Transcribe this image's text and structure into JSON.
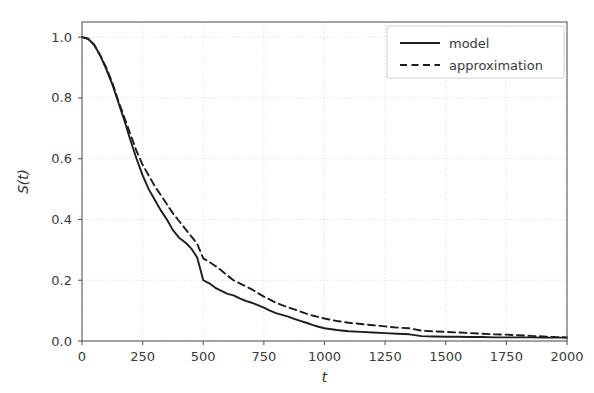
{
  "chart_data": {
    "type": "line",
    "title": "",
    "xlabel": "t",
    "ylabel": "S(t)",
    "xlim": [
      0,
      2000
    ],
    "ylim": [
      0.0,
      1.05
    ],
    "grid": true,
    "legend_position": "upper right",
    "x_ticks": [
      0,
      250,
      500,
      750,
      1000,
      1250,
      1500,
      1750,
      2000
    ],
    "x_tick_labels": [
      "0",
      "250",
      "500",
      "750",
      "1000",
      "1250",
      "1500",
      "1750",
      "2000"
    ],
    "y_ticks": [
      0.0,
      0.2,
      0.4,
      0.6,
      0.8,
      1.0
    ],
    "y_tick_labels": [
      "0.0",
      "0.2",
      "0.4",
      "0.6",
      "0.8",
      "1.0"
    ],
    "x": [
      0,
      25,
      50,
      75,
      100,
      125,
      150,
      175,
      200,
      225,
      250,
      275,
      300,
      325,
      350,
      375,
      400,
      425,
      450,
      475,
      500,
      525,
      550,
      575,
      600,
      625,
      650,
      675,
      700,
      725,
      750,
      775,
      800,
      825,
      850,
      875,
      900,
      925,
      950,
      975,
      1000,
      1050,
      1100,
      1150,
      1200,
      1250,
      1300,
      1350,
      1400,
      1450,
      1500,
      1550,
      1600,
      1650,
      1700,
      1750,
      1800,
      1850,
      1900,
      1950,
      2000
    ],
    "series": [
      {
        "name": "model",
        "style": "solid",
        "color": "#1d1d1d",
        "values": [
          1.0,
          0.995,
          0.975,
          0.94,
          0.895,
          0.845,
          0.785,
          0.725,
          0.66,
          0.6,
          0.545,
          0.5,
          0.465,
          0.43,
          0.4,
          0.365,
          0.34,
          0.325,
          0.305,
          0.275,
          0.2,
          0.19,
          0.175,
          0.165,
          0.155,
          0.15,
          0.14,
          0.132,
          0.126,
          0.118,
          0.11,
          0.1,
          0.092,
          0.086,
          0.08,
          0.073,
          0.066,
          0.06,
          0.053,
          0.047,
          0.042,
          0.036,
          0.032,
          0.03,
          0.028,
          0.026,
          0.024,
          0.022,
          0.016,
          0.015,
          0.014,
          0.014,
          0.013,
          0.013,
          0.012,
          0.012,
          0.012,
          0.012,
          0.011,
          0.011,
          0.011
        ]
      },
      {
        "name": "approximation",
        "style": "dashed",
        "color": "#1d1d1d",
        "values": [
          1.0,
          0.995,
          0.975,
          0.94,
          0.9,
          0.85,
          0.79,
          0.735,
          0.68,
          0.625,
          0.58,
          0.545,
          0.51,
          0.48,
          0.45,
          0.42,
          0.395,
          0.37,
          0.345,
          0.32,
          0.272,
          0.26,
          0.247,
          0.232,
          0.215,
          0.2,
          0.19,
          0.18,
          0.17,
          0.158,
          0.146,
          0.136,
          0.126,
          0.118,
          0.111,
          0.104,
          0.097,
          0.09,
          0.084,
          0.079,
          0.074,
          0.066,
          0.06,
          0.056,
          0.052,
          0.048,
          0.044,
          0.042,
          0.034,
          0.032,
          0.03,
          0.028,
          0.026,
          0.024,
          0.022,
          0.021,
          0.019,
          0.017,
          0.015,
          0.013,
          0.012
        ]
      }
    ]
  }
}
